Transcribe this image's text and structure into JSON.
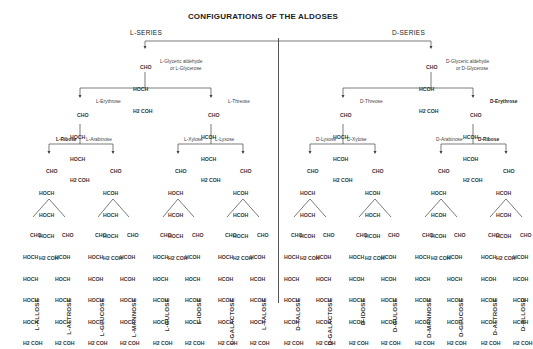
{
  "title": "CONFIGURATIONS OF THE ALDOSES",
  "l_series": {
    "label": "L-SERIES",
    "triose": {
      "rows": [
        "CHO",
        "HOCH",
        "H2 COH"
      ],
      "label1": "L-Glyceric aldehyde",
      "label2": "or L-Glycerose"
    },
    "tetroses": [
      {
        "name": "L-Erythrose",
        "rows": [
          "CHO",
          "HOCH",
          "HOCH",
          "H2 COH"
        ]
      },
      {
        "name": "L-Threose",
        "rows": [
          "CHO",
          "HCOH",
          "HOCH",
          "H2 COH"
        ]
      }
    ],
    "pentoses": [
      {
        "name": "L-Ribose",
        "rows": [
          "CHO",
          "HOCH",
          "HOCH",
          "HOCH",
          "H2 COH"
        ]
      },
      {
        "name": "L-Arabinose",
        "rows": [
          "CHO",
          "HCOH",
          "HOCH",
          "HOCH",
          "H2 COH"
        ]
      },
      {
        "name": "L-Xylose",
        "rows": [
          "CHO",
          "HOCH",
          "HCOH",
          "HOCH",
          "H2 COH"
        ]
      },
      {
        "name": "L-Lyxose",
        "rows": [
          "CHO",
          "HCOH",
          "HCOH",
          "HOCH",
          "H2 COH"
        ]
      }
    ],
    "hexoses": [
      {
        "name": "L-ALLOSE",
        "rows": [
          "CHO",
          "HOCH",
          "HOCH",
          "HOCH",
          "HOCH",
          "H2 COH"
        ]
      },
      {
        "name": "L-ALTROSE",
        "rows": [
          "CHO",
          "HCOH",
          "HOCH",
          "HOCH",
          "HOCH",
          "H2 COH"
        ]
      },
      {
        "name": "L-GLUCOSE",
        "rows": [
          "CHO",
          "HOCH",
          "HCOH",
          "HOCH",
          "HOCH",
          "H2 COH"
        ]
      },
      {
        "name": "L-MANNOSE",
        "rows": [
          "CHO",
          "HCOH",
          "HCOH",
          "HOCH",
          "HOCH",
          "H2 COH"
        ]
      },
      {
        "name": "L-GULOSE",
        "rows": [
          "CHO",
          "HOCH",
          "HOCH",
          "HCOH",
          "HOCH",
          "H2 COH"
        ]
      },
      {
        "name": "L-IDOSE",
        "rows": [
          "CHO",
          "HCOH",
          "HOCH",
          "HCOH",
          "HOCH",
          "H2 COH"
        ]
      },
      {
        "name": "L-GALACTOSE",
        "rows": [
          "CHO",
          "HOCH",
          "HCOH",
          "HCOH",
          "HOCH",
          "H2 COH"
        ]
      },
      {
        "name": "L-TALOSE",
        "rows": [
          "CHO",
          "HCOH",
          "HCOH",
          "HCOH",
          "HOCH",
          "H2 COH"
        ]
      }
    ]
  },
  "d_series": {
    "label": "D-SERIES",
    "triose": {
      "rows": [
        "CHO",
        "HCOH",
        "H2 COH"
      ],
      "label1": "D-Glyceric aldehyde",
      "label2": "or D-Glycerose"
    },
    "tetroses": [
      {
        "name": "D-Threose",
        "rows": [
          "CHO",
          "HOCH",
          "HCOH",
          "H2 COH"
        ]
      },
      {
        "name": "D-Erythrose",
        "rows": [
          "CHO",
          "HCOH",
          "HCOH",
          "H2 COH"
        ]
      }
    ],
    "pentoses": [
      {
        "name": "D-Lyxose",
        "rows": [
          "CHO",
          "HOCH",
          "HOCH",
          "HCOH",
          "H2 COH"
        ]
      },
      {
        "name": "D-Xylose",
        "rows": [
          "CHO",
          "HCOH",
          "HOCH",
          "HCOH",
          "H2 COH"
        ]
      },
      {
        "name": "D-Arabinose",
        "rows": [
          "CHO",
          "HOCH",
          "HCOH",
          "HCOH",
          "H2 COH"
        ]
      },
      {
        "name": "D-Ribose",
        "rows": [
          "CHO",
          "HCOH",
          "HCOH",
          "HCOH",
          "H2 COH"
        ]
      }
    ],
    "hexoses": [
      {
        "name": "D-TALOSE",
        "rows": [
          "CHO",
          "HOCH",
          "HOCH",
          "HOCH",
          "HCOH",
          "H2 COH"
        ]
      },
      {
        "name": "D-GALACTOSE",
        "rows": [
          "CHO",
          "HCOH",
          "HOCH",
          "HOCH",
          "HCOH",
          "H2 COH"
        ]
      },
      {
        "name": "D-IDOSE",
        "rows": [
          "CHO",
          "HOCH",
          "HCOH",
          "HOCH",
          "HCOH",
          "H2 COH"
        ]
      },
      {
        "name": "D-GULOSE",
        "rows": [
          "CHO",
          "HCOH",
          "HCOH",
          "HOCH",
          "HCOH",
          "H2 COH"
        ]
      },
      {
        "name": "D-MANNOSE",
        "rows": [
          "CHO",
          "HOCH",
          "HOCH",
          "HCOH",
          "HCOH",
          "H2 COH"
        ]
      },
      {
        "name": "D-GLUCOSE",
        "rows": [
          "CHO",
          "HCOH",
          "HOCH",
          "HCOH",
          "HCOH",
          "H2 COH"
        ]
      },
      {
        "name": "D-ALTROSE",
        "rows": [
          "CHO",
          "HOCH",
          "HCOH",
          "HCOH",
          "HCOH",
          "H2 COH"
        ]
      },
      {
        "name": "D-ALLOSE",
        "rows": [
          "CHO",
          "HCOH",
          "HCOH",
          "HCOH",
          "HCOH",
          "H2 COH"
        ]
      }
    ]
  }
}
